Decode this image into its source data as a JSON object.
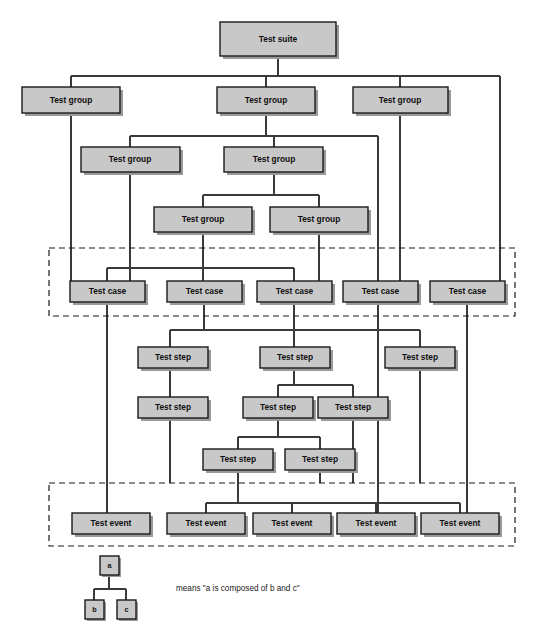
{
  "diagram": {
    "colors": {
      "node_fill": "#c8c8c8",
      "node_stroke": "#1a1a1a",
      "node_shadow": "#9a9a9a",
      "edge": "#3a3a3a",
      "dashed_box": "#1a1a1a",
      "background": "#ffffff"
    },
    "labels": {
      "test_suite": "Test suite",
      "test_group": "Test group",
      "test_case": "Test case",
      "test_step": "Test step",
      "test_event": "Test event"
    },
    "nodes": {
      "suite": [
        {
          "id": "suite-1",
          "label": "Test suite",
          "x": 220,
          "y": 22,
          "w": 116,
          "h": 34
        }
      ],
      "groups_level_1": [
        {
          "id": "group-1",
          "label": "Test group",
          "x": 22,
          "y": 87,
          "w": 98,
          "h": 26
        },
        {
          "id": "group-2",
          "label": "Test group",
          "x": 217,
          "y": 87,
          "w": 98,
          "h": 26
        },
        {
          "id": "group-3",
          "label": "Test group",
          "x": 353,
          "y": 87,
          "w": 95,
          "h": 26
        }
      ],
      "groups_level_2": [
        {
          "id": "group-4",
          "label": "Test group",
          "x": 81,
          "y": 147,
          "w": 99,
          "h": 25
        },
        {
          "id": "group-5",
          "label": "Test group",
          "x": 224,
          "y": 147,
          "w": 99,
          "h": 25
        }
      ],
      "groups_level_3": [
        {
          "id": "group-6",
          "label": "Test group",
          "x": 154,
          "y": 207,
          "w": 98,
          "h": 25
        },
        {
          "id": "group-7",
          "label": "Test group",
          "x": 270,
          "y": 207,
          "w": 98,
          "h": 25
        }
      ],
      "cases": [
        {
          "id": "case-1",
          "label": "Test case",
          "x": 70,
          "y": 281,
          "w": 75,
          "h": 21
        },
        {
          "id": "case-2",
          "label": "Test case",
          "x": 167,
          "y": 281,
          "w": 75,
          "h": 21
        },
        {
          "id": "case-3",
          "label": "Test case",
          "x": 257,
          "y": 281,
          "w": 75,
          "h": 21
        },
        {
          "id": "case-4",
          "label": "Test case",
          "x": 343,
          "y": 281,
          "w": 75,
          "h": 21
        },
        {
          "id": "case-5",
          "label": "Test case",
          "x": 430,
          "y": 281,
          "w": 75,
          "h": 21
        }
      ],
      "steps_level_1": [
        {
          "id": "step-1",
          "label": "Test step",
          "x": 138,
          "y": 347,
          "w": 70,
          "h": 21
        },
        {
          "id": "step-2",
          "label": "Test step",
          "x": 260,
          "y": 347,
          "w": 70,
          "h": 21
        },
        {
          "id": "step-3",
          "label": "Test step",
          "x": 385,
          "y": 347,
          "w": 70,
          "h": 21
        }
      ],
      "steps_level_2": [
        {
          "id": "step-4",
          "label": "Test step",
          "x": 138,
          "y": 397,
          "w": 70,
          "h": 21
        },
        {
          "id": "step-5",
          "label": "Test step",
          "x": 243,
          "y": 397,
          "w": 70,
          "h": 21
        },
        {
          "id": "step-6",
          "label": "Test step",
          "x": 318,
          "y": 397,
          "w": 70,
          "h": 21
        }
      ],
      "steps_level_3": [
        {
          "id": "step-7",
          "label": "Test step",
          "x": 203,
          "y": 449,
          "w": 70,
          "h": 21
        },
        {
          "id": "step-8",
          "label": "Test step",
          "x": 285,
          "y": 449,
          "w": 70,
          "h": 21
        }
      ],
      "events": [
        {
          "id": "event-1",
          "label": "Test event",
          "x": 72,
          "y": 513,
          "w": 78,
          "h": 21
        },
        {
          "id": "event-2",
          "label": "Test event",
          "x": 167,
          "y": 513,
          "w": 78,
          "h": 21
        },
        {
          "id": "event-3",
          "label": "Test event",
          "x": 253,
          "y": 513,
          "w": 78,
          "h": 21
        },
        {
          "id": "event-4",
          "label": "Test event",
          "x": 337,
          "y": 513,
          "w": 78,
          "h": 21
        },
        {
          "id": "event-5",
          "label": "Test event",
          "x": 421,
          "y": 513,
          "w": 78,
          "h": 21
        }
      ]
    },
    "dashed_boxes": [
      {
        "id": "test-case-band",
        "x": 49,
        "y": 248,
        "w": 466,
        "h": 68
      },
      {
        "id": "test-event-band",
        "x": 49,
        "y": 483,
        "w": 466,
        "h": 63
      }
    ],
    "legend": {
      "nodes": [
        {
          "id": "legend-a",
          "label": "a",
          "x": 100,
          "y": 556,
          "w": 19,
          "h": 19
        },
        {
          "id": "legend-b",
          "label": "b",
          "x": 85,
          "y": 600,
          "w": 19,
          "h": 19
        },
        {
          "id": "legend-c",
          "label": "c",
          "x": 117,
          "y": 600,
          "w": 19,
          "h": 19
        }
      ],
      "note": "means \"a is composed of b and c\"",
      "note_x": 176,
      "note_y": 589
    }
  }
}
